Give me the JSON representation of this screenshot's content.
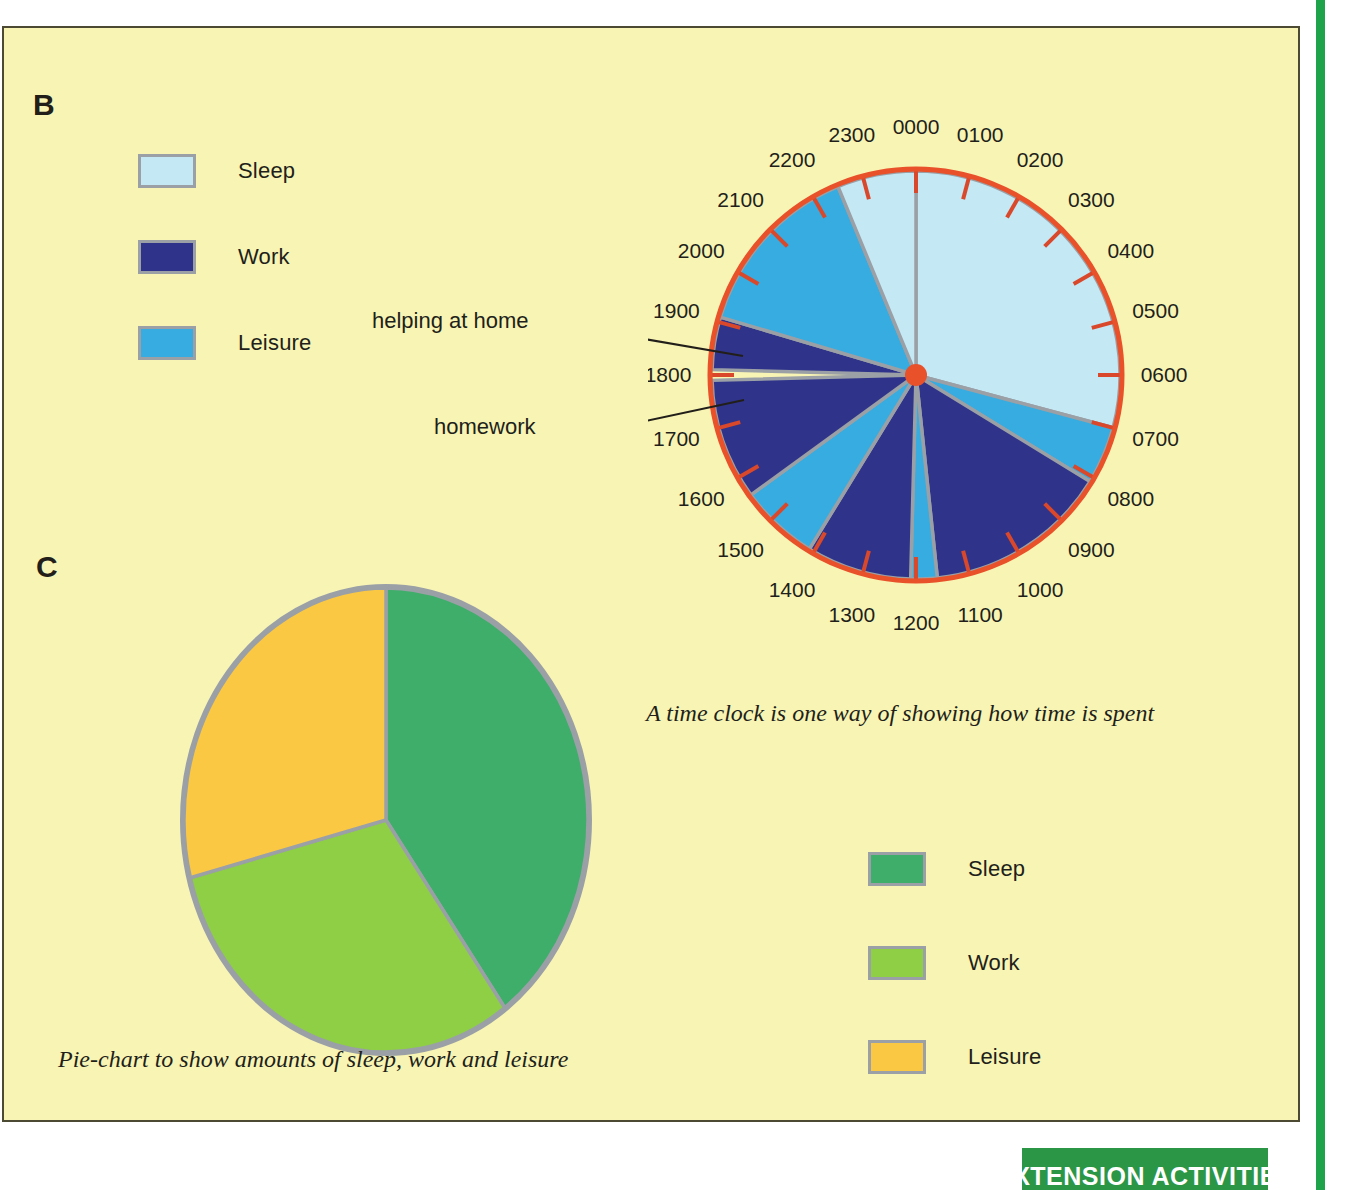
{
  "page": {
    "background_color": "#ffffff",
    "panel_color": "#f8f4b4",
    "rule_color": "#1fa34a"
  },
  "sections": {
    "b_letter": "B",
    "c_letter": "C"
  },
  "clock_legend": {
    "items": [
      {
        "label": "Sleep",
        "color": "#c5e8f5"
      },
      {
        "label": "Work",
        "color": "#2f3389"
      },
      {
        "label": "Leisure",
        "color": "#36ace0"
      }
    ]
  },
  "pie_legend": {
    "items": [
      {
        "label": "Sleep",
        "color": "#3fae6a"
      },
      {
        "label": "Work",
        "color": "#8ecf45"
      },
      {
        "label": "Leisure",
        "color": "#fbc843"
      }
    ]
  },
  "callouts": {
    "helping_at_home": "helping at home",
    "homework": "homework"
  },
  "captions": {
    "clock": "A time clock is one way of showing how time is spent",
    "pie": "Pie-chart to show amounts of sleep, work and leisure"
  },
  "extension_tab": {
    "label": "EXTENSION ACTIVITIES",
    "color": "#2a9646"
  },
  "chart_data": [
    {
      "type": "pie",
      "name": "time-clock",
      "title": "A time clock is one way of showing how time is spent",
      "units": "hours (24-hour clock)",
      "rim_color": "#e8512a",
      "hub_color": "#e8512a",
      "separator_color": "#9aa0a6",
      "start_at": "0000 at top, clockwise",
      "hour_labels": [
        "0000",
        "0100",
        "0200",
        "0300",
        "0400",
        "0500",
        "0600",
        "0700",
        "0800",
        "0900",
        "1000",
        "1100",
        "1200",
        "1300",
        "1400",
        "1500",
        "1600",
        "1700",
        "1800",
        "1900",
        "2000",
        "2100",
        "2200",
        "2300"
      ],
      "legend": [
        "Sleep",
        "Work",
        "Leisure"
      ],
      "colors": {
        "Sleep": "#c5e8f5",
        "Work": "#2f3389",
        "Leisure": "#36ace0"
      },
      "segments": [
        {
          "category": "Sleep",
          "start_hour": 0.0,
          "end_hour": 7.0,
          "duration_hours": 7.0,
          "label": ""
        },
        {
          "category": "Leisure",
          "start_hour": 7.0,
          "end_hour": 8.1,
          "duration_hours": 1.1,
          "label": ""
        },
        {
          "category": "Work",
          "start_hour": 8.1,
          "end_hour": 11.6,
          "duration_hours": 3.5,
          "label": ""
        },
        {
          "category": "Leisure",
          "start_hour": 11.6,
          "end_hour": 12.1,
          "duration_hours": 0.5,
          "label": ""
        },
        {
          "category": "Work",
          "start_hour": 12.1,
          "end_hour": 14.1,
          "duration_hours": 2.0,
          "label": ""
        },
        {
          "category": "Leisure",
          "start_hour": 14.1,
          "end_hour": 15.6,
          "duration_hours": 1.5,
          "label": ""
        },
        {
          "category": "Work",
          "start_hour": 15.6,
          "end_hour": 17.9,
          "duration_hours": 2.3,
          "label": "homework"
        },
        {
          "category": "Work",
          "start_hour": 18.1,
          "end_hour": 19.1,
          "duration_hours": 1.0,
          "label": "helping at home"
        },
        {
          "category": "Leisure",
          "start_hour": 19.1,
          "end_hour": 22.5,
          "duration_hours": 3.4,
          "label": ""
        },
        {
          "category": "Sleep",
          "start_hour": 22.5,
          "end_hour": 24.0,
          "duration_hours": 1.5,
          "label": ""
        }
      ],
      "totals": [
        {
          "category": "Sleep",
          "hours": 8.5
        },
        {
          "category": "Work",
          "hours": 8.8
        },
        {
          "category": "Leisure",
          "hours": 6.5
        }
      ]
    },
    {
      "type": "pie",
      "name": "summary-pie",
      "title": "Pie-chart to show amounts of sleep, work and leisure",
      "labels": [
        "Sleep",
        "Work",
        "Leisure"
      ],
      "values": [
        40,
        31,
        29
      ],
      "units": "percent of day",
      "colors": [
        "#3fae6a",
        "#8ecf45",
        "#fbc843"
      ],
      "outline_color": "#9aa0a6",
      "start_angle_deg": 0,
      "direction": "clockwise",
      "legend_position": "right"
    }
  ]
}
